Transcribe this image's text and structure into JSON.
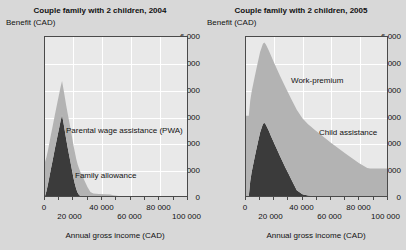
{
  "figure": {
    "background": "#d8d8d8",
    "colors": {
      "dark_series": "#3b3b3b",
      "light_series": "#b3b3b3",
      "plot_background": "#e9e9e9",
      "gridline": "#ffffff",
      "axis": "#4a4a4a",
      "text": "#111111"
    }
  },
  "chart_data": [
    {
      "type": "area",
      "stacked": true,
      "title": "Couple family with 2 children, 2004",
      "xlabel": "Annual gross income (CAD)",
      "ylabel": "Benefit (CAD)",
      "ylim": [
        0,
        6000
      ],
      "xlim": [
        0,
        100000
      ],
      "yticks": [
        0,
        1000,
        2000,
        3000,
        4000,
        5000,
        6000
      ],
      "ytick_labels": [
        "0",
        "1 000",
        "2 000",
        "3 000",
        "4 000",
        "5 000",
        "6 000"
      ],
      "xticks": [
        0,
        20000,
        40000,
        60000,
        80000,
        100000
      ],
      "xtick_labels": [
        "0",
        "20 000",
        "40 000",
        "60 000",
        "80 000",
        "100 000"
      ],
      "grid": true,
      "legend_position": "inline-annotations",
      "series": [
        {
          "name": "Family allowance",
          "color": "#b3b3b3",
          "x": [
            0,
            2000,
            4000,
            6000,
            10000,
            14000,
            18000,
            21000,
            24000,
            26000,
            28000,
            30000,
            32000,
            34000,
            38000,
            42000,
            46000,
            48000,
            52000,
            100000
          ],
          "values": [
            1280,
            1280,
            1280,
            1280,
            1280,
            1280,
            1280,
            1200,
            1000,
            800,
            560,
            330,
            150,
            95,
            80,
            70,
            55,
            30,
            0,
            0
          ]
        },
        {
          "name": "Parental wage assistance (PWA)",
          "color": "#3b3b3b",
          "x": [
            0,
            1000,
            2000,
            3000,
            4000,
            5000,
            6000,
            7000,
            8000,
            9000,
            10000,
            11000,
            12000,
            13000,
            14000,
            15000,
            16000,
            17000,
            18000,
            19000,
            20000,
            21000,
            22000,
            23000,
            24000,
            25000,
            26000,
            100000
          ],
          "values": [
            0,
            180,
            420,
            700,
            980,
            1250,
            1520,
            1800,
            2060,
            2320,
            2580,
            2840,
            3060,
            2760,
            2440,
            2120,
            1820,
            1540,
            1260,
            980,
            700,
            460,
            260,
            120,
            40,
            0,
            0,
            0
          ]
        }
      ],
      "annotations": [
        {
          "text": "Parental wage assistance (PWA)",
          "x": 22000,
          "y": 2600
        },
        {
          "text": "Family allowance",
          "x": 26000,
          "y": 900
        }
      ]
    },
    {
      "type": "area",
      "stacked": true,
      "title": "Couple family with 2 children, 2005",
      "xlabel": "Annual gross income (CAD)",
      "ylabel": "Benefit (CAD)",
      "ylim": [
        0,
        6000
      ],
      "xlim": [
        0,
        100000
      ],
      "yticks": [
        0,
        1000,
        2000,
        3000,
        4000,
        5000,
        6000
      ],
      "ytick_labels": [
        "0",
        "1 000",
        "2 000",
        "3 000",
        "4 000",
        "5 000",
        "6 000"
      ],
      "xticks": [
        0,
        20000,
        40000,
        60000,
        80000,
        100000
      ],
      "xtick_labels": [
        "0",
        "20 000",
        "40 000",
        "60 000",
        "80 000",
        "100 000"
      ],
      "grid": true,
      "legend_position": "inline-annotations",
      "series": [
        {
          "name": "Child assistance",
          "color": "#b3b3b3",
          "x": [
            0,
            10000,
            20000,
            30000,
            36000,
            40000,
            50000,
            60000,
            70000,
            80000,
            86000,
            88000,
            92000,
            100000
          ],
          "values": [
            3030,
            3030,
            3030,
            3030,
            3030,
            2860,
            2440,
            2020,
            1620,
            1250,
            1060,
            1040,
            1040,
            1040
          ]
        },
        {
          "name": "Work-premium",
          "color": "#3b3b3b",
          "x": [
            0,
            1000,
            2000,
            3000,
            4000,
            6000,
            8000,
            10000,
            12000,
            13000,
            14000,
            16000,
            18000,
            20000,
            24000,
            28000,
            32000,
            36000,
            40000,
            44000,
            46000,
            48000,
            100000
          ],
          "values": [
            0,
            0,
            0,
            560,
            900,
            1420,
            1920,
            2400,
            2720,
            2760,
            2700,
            2480,
            2230,
            1990,
            1520,
            1070,
            640,
            220,
            70,
            20,
            10,
            0,
            0
          ]
        }
      ],
      "annotations": [
        {
          "text": "Work-premium",
          "x": 34000,
          "y": 4450
        },
        {
          "text": "Child assistance",
          "x": 58000,
          "y": 2720
        }
      ]
    }
  ]
}
